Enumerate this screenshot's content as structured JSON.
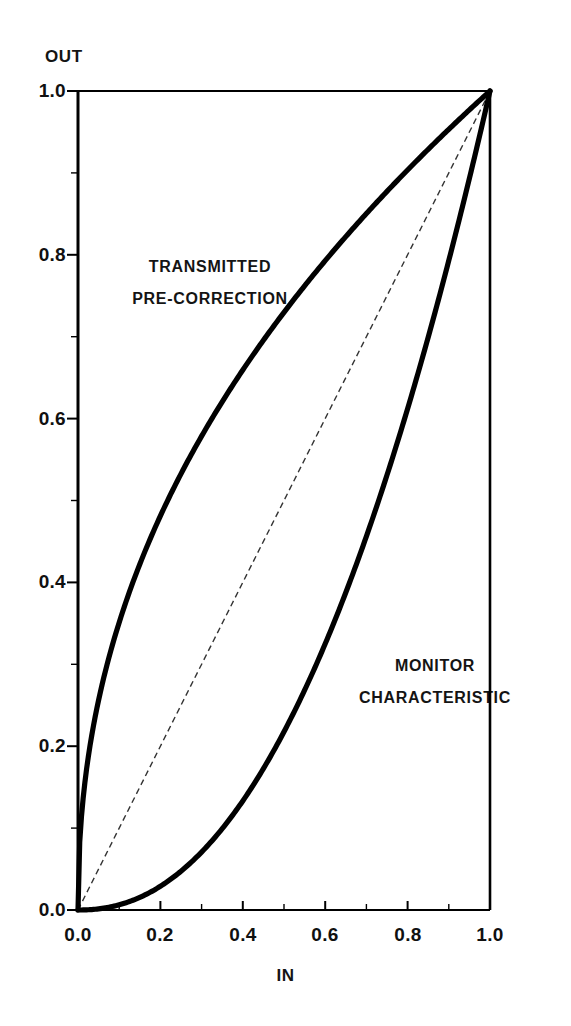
{
  "chart_data": {
    "type": "line",
    "title": "",
    "xlabel": "IN",
    "ylabel": "OUT",
    "xlim": [
      0.0,
      1.0
    ],
    "ylim": [
      0.0,
      1.0
    ],
    "grid": false,
    "legend": "inline-annotations",
    "xticks": [
      "0.0",
      "0.2",
      "0.4",
      "0.6",
      "0.8",
      "1.0"
    ],
    "xtick_values": [
      0.0,
      0.2,
      0.4,
      0.6,
      0.8,
      1.0
    ],
    "yticks": [
      "0.0",
      "0.2",
      "0.4",
      "0.6",
      "0.8",
      "1.0"
    ],
    "ytick_values": [
      0.0,
      0.2,
      0.4,
      0.6,
      0.8,
      1.0
    ],
    "minor_tick_step": 0.1,
    "series": [
      {
        "name": "TRANSMITTED PRE-CORRECTION",
        "style": "solid-thick",
        "color": "#000000",
        "gamma": 0.4545,
        "x": [
          0.0,
          0.02,
          0.05,
          0.1,
          0.15,
          0.2,
          0.25,
          0.3,
          0.35,
          0.4,
          0.45,
          0.5,
          0.55,
          0.6,
          0.65,
          0.7,
          0.75,
          0.8,
          0.85,
          0.9,
          0.95,
          1.0
        ],
        "y": [
          0.0,
          0.182,
          0.275,
          0.376,
          0.447,
          0.504,
          0.553,
          0.595,
          0.634,
          0.668,
          0.7,
          0.73,
          0.758,
          0.784,
          0.809,
          0.832,
          0.855,
          0.877,
          0.897,
          0.917,
          0.937,
          1.0
        ]
      },
      {
        "name": "MONITOR CHARACTERISTIC",
        "style": "solid-thick",
        "color": "#000000",
        "gamma": 2.2,
        "x": [
          0.0,
          0.05,
          0.1,
          0.15,
          0.2,
          0.25,
          0.3,
          0.35,
          0.4,
          0.45,
          0.5,
          0.55,
          0.6,
          0.65,
          0.7,
          0.75,
          0.8,
          0.85,
          0.9,
          0.95,
          1.0
        ],
        "y": [
          0.0,
          0.002,
          0.008,
          0.018,
          0.033,
          0.054,
          0.08,
          0.113,
          0.152,
          0.198,
          0.25,
          0.31,
          0.377,
          0.452,
          0.534,
          0.624,
          0.722,
          0.828,
          0.942,
          0.965,
          1.0
        ]
      },
      {
        "name": "linear reference",
        "style": "dashed-thin",
        "color": "#333333",
        "gamma": 1.0,
        "x": [
          0.0,
          1.0
        ],
        "y": [
          0.0,
          1.0
        ]
      }
    ],
    "annotations": [
      {
        "text": "TRANSMITTED",
        "x": 0.26,
        "y": 0.775
      },
      {
        "text": "PRE-CORRECTION",
        "x": 0.26,
        "y": 0.74
      },
      {
        "text": "MONITOR",
        "x": 0.87,
        "y": 0.296
      },
      {
        "text": "CHARACTERISTIC",
        "x": 0.87,
        "y": 0.258
      }
    ]
  },
  "axes": {
    "y_title": "OUT",
    "x_title": "IN",
    "y_tick_labels": [
      "1.0",
      "0.8",
      "0.6",
      "0.4",
      "0.2",
      "0.0"
    ],
    "x_tick_labels": [
      "0.0",
      "0.2",
      "0.4",
      "0.6",
      "0.8",
      "1.0"
    ]
  },
  "annotations": {
    "transmitted_line1": "TRANSMITTED",
    "transmitted_line2": "PRE-CORRECTION",
    "monitor_line1": "MONITOR",
    "monitor_line2": "CHARACTERISTIC"
  },
  "colors": {
    "background": "#ffffff",
    "axis": "#000000",
    "curve": "#000000",
    "dashed": "#444444",
    "text": "#111111"
  }
}
